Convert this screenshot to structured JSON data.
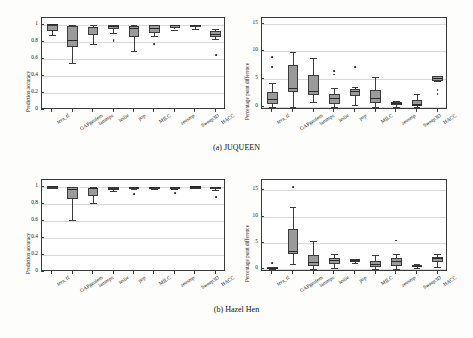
{
  "figure": {
    "captions": [
      {
        "id": "a",
        "text": "(a) JUQUEEN"
      },
      {
        "id": "b",
        "text": "(b) Hazel Hen"
      }
    ]
  },
  "chart_data": [
    {
      "type": "box",
      "panel": "juqueen-accuracy",
      "title": "",
      "xlabel": "",
      "ylabel": "Prediction accuracy",
      "ylim": [
        0,
        1.08
      ],
      "yticks": [
        0,
        0.2,
        0.4,
        0.6,
        0.8,
        1
      ],
      "ytick_labels": [
        "0",
        "0.2",
        "0.4",
        "0.6",
        "0.8",
        "1"
      ],
      "grid": true,
      "categories": [
        "tera_tf",
        "GAPgeofem",
        "lammps",
        "leslie",
        "pop",
        "MILC",
        "zeusmp",
        "Sweep3D",
        "HACC"
      ],
      "boxes": [
        {
          "category": "tera_tf",
          "q1": 0.925,
          "median": 1.0,
          "q3": 1.0,
          "whisker_low": 0.885,
          "whisker_high": 1.0,
          "outliers": []
        },
        {
          "category": "GAPgeofem",
          "q1": 0.745,
          "median": 0.815,
          "q3": 0.985,
          "whisker_low": 0.555,
          "whisker_high": 1.0,
          "outliers": []
        },
        {
          "category": "lammps",
          "q1": 0.875,
          "median": 0.965,
          "q3": 0.975,
          "whisker_low": 0.775,
          "whisker_high": 1.0,
          "outliers": []
        },
        {
          "category": "leslie",
          "q1": 0.945,
          "median": 0.975,
          "q3": 0.995,
          "whisker_low": 0.905,
          "whisker_high": 1.0,
          "outliers": [
            0.825,
            0.805
          ]
        },
        {
          "category": "pop",
          "q1": 0.855,
          "median": 0.955,
          "q3": 0.985,
          "whisker_low": 0.69,
          "whisker_high": 1.0,
          "outliers": []
        },
        {
          "category": "MILC",
          "q1": 0.905,
          "median": 0.955,
          "q3": 0.995,
          "whisker_low": 0.87,
          "whisker_high": 1.0,
          "outliers": [
            0.775
          ]
        },
        {
          "category": "zeusmp",
          "q1": 0.965,
          "median": 0.995,
          "q3": 1.0,
          "whisker_low": 0.945,
          "whisker_high": 1.0,
          "outliers": []
        },
        {
          "category": "Sweep3D",
          "q1": 0.975,
          "median": 0.995,
          "q3": 1.0,
          "whisker_low": 0.955,
          "whisker_high": 1.0,
          "outliers": []
        },
        {
          "category": "HACC",
          "q1": 0.855,
          "median": 0.885,
          "q3": 0.925,
          "whisker_low": 0.835,
          "whisker_high": 0.955,
          "outliers": [
            0.645
          ]
        }
      ]
    },
    {
      "type": "box",
      "panel": "juqueen-difference",
      "title": "",
      "xlabel": "",
      "ylabel": "Percentage point difference",
      "ylim": [
        -0.6,
        16
      ],
      "yticks": [
        0,
        5,
        10,
        15
      ],
      "ytick_labels": [
        "0",
        "5",
        "10",
        "15"
      ],
      "grid": true,
      "categories": [
        "tera_tf",
        "GAPgeofem",
        "lammps",
        "leslie",
        "pop",
        "MILC",
        "zeusmp",
        "Sweep3D",
        "HACC"
      ],
      "boxes": [
        {
          "category": "tera_tf",
          "q1": 0.5,
          "median": 1.3,
          "q3": 2.7,
          "whisker_low": 0.0,
          "whisker_high": 4.2,
          "outliers": [
            9.0,
            7.1
          ]
        },
        {
          "category": "GAPgeofem",
          "q1": 2.7,
          "median": 3.2,
          "q3": 7.6,
          "whisker_low": 0.0,
          "whisker_high": 9.9,
          "outliers": []
        },
        {
          "category": "lammps",
          "q1": 2.1,
          "median": 2.8,
          "q3": 5.8,
          "whisker_low": 0.8,
          "whisker_high": 8.8,
          "outliers": []
        },
        {
          "category": "leslie",
          "q1": 0.5,
          "median": 1.5,
          "q3": 2.3,
          "whisker_low": 0.0,
          "whisker_high": 3.4,
          "outliers": [
            6.4,
            5.8
          ]
        },
        {
          "category": "pop",
          "q1": 2.0,
          "median": 2.8,
          "q3": 3.1,
          "whisker_low": 0.3,
          "whisker_high": 3.6,
          "outliers": [
            7.1
          ]
        },
        {
          "category": "MILC",
          "q1": 0.6,
          "median": 1.5,
          "q3": 3.0,
          "whisker_low": 0.0,
          "whisker_high": 5.4,
          "outliers": []
        },
        {
          "category": "zeusmp",
          "q1": 0.3,
          "median": 0.6,
          "q3": 0.9,
          "whisker_low": 0.0,
          "whisker_high": 1.1,
          "outliers": []
        },
        {
          "category": "Sweep3D",
          "q1": 0.1,
          "median": 0.3,
          "q3": 1.2,
          "whisker_low": 0.0,
          "whisker_high": 2.3,
          "outliers": []
        },
        {
          "category": "HACC",
          "q1": 4.7,
          "median": 5.1,
          "q3": 5.5,
          "whisker_low": 4.6,
          "whisker_high": 5.6,
          "outliers": [
            3.0,
            2.2
          ]
        }
      ]
    },
    {
      "type": "box",
      "panel": "hazelhen-accuracy",
      "title": "",
      "xlabel": "",
      "ylabel": "Prediction accuracy",
      "ylim": [
        0,
        1.08
      ],
      "yticks": [
        0,
        0.2,
        0.4,
        0.6,
        0.8,
        1
      ],
      "ytick_labels": [
        "0",
        "0.2",
        "0.4",
        "0.6",
        "0.8",
        "1"
      ],
      "grid": true,
      "categories": [
        "tera_tf",
        "GAPgeofem",
        "lammps",
        "leslie",
        "pop",
        "MILC",
        "zeusmp",
        "Sweep3D",
        "HACC"
      ],
      "boxes": [
        {
          "category": "tera_tf",
          "q1": 0.995,
          "median": 1.0,
          "q3": 1.0,
          "whisker_low": 0.99,
          "whisker_high": 1.0,
          "outliers": []
        },
        {
          "category": "GAPgeofem",
          "q1": 0.855,
          "median": 0.965,
          "q3": 0.995,
          "whisker_low": 0.615,
          "whisker_high": 1.0,
          "outliers": []
        },
        {
          "category": "lammps",
          "q1": 0.895,
          "median": 0.975,
          "q3": 0.985,
          "whisker_low": 0.805,
          "whisker_high": 1.0,
          "outliers": []
        },
        {
          "category": "leslie",
          "q1": 0.965,
          "median": 0.985,
          "q3": 0.995,
          "whisker_low": 0.95,
          "whisker_high": 1.0,
          "outliers": []
        },
        {
          "category": "pop",
          "q1": 0.98,
          "median": 0.99,
          "q3": 0.998,
          "whisker_low": 0.975,
          "whisker_high": 1.0,
          "outliers": [
            0.915
          ]
        },
        {
          "category": "MILC",
          "q1": 0.985,
          "median": 0.995,
          "q3": 1.0,
          "whisker_low": 0.975,
          "whisker_high": 1.0,
          "outliers": []
        },
        {
          "category": "zeusmp",
          "q1": 0.985,
          "median": 0.995,
          "q3": 1.0,
          "whisker_low": 0.975,
          "whisker_high": 1.0,
          "outliers": [
            0.925
          ]
        },
        {
          "category": "Sweep3D",
          "q1": 0.99,
          "median": 0.998,
          "q3": 1.0,
          "whisker_low": 0.985,
          "whisker_high": 1.0,
          "outliers": []
        },
        {
          "category": "HACC",
          "q1": 0.975,
          "median": 0.99,
          "q3": 1.0,
          "whisker_low": 0.96,
          "whisker_high": 1.0,
          "outliers": [
            0.875
          ]
        }
      ]
    },
    {
      "type": "box",
      "panel": "hazelhen-difference",
      "title": "",
      "xlabel": "",
      "ylabel": "Percentage point difference",
      "ylim": [
        -0.6,
        17
      ],
      "yticks": [
        0,
        5,
        10,
        15
      ],
      "ytick_labels": [
        "0",
        "5",
        "10",
        "15"
      ],
      "grid": true,
      "categories": [
        "tera_tf",
        "GAPgeofem",
        "lammps",
        "leslie",
        "pop",
        "MILC",
        "zeusmp",
        "Sweep3D",
        "HACC"
      ],
      "boxes": [
        {
          "category": "tera_tf",
          "q1": 0.0,
          "median": 0.1,
          "q3": 0.3,
          "whisker_low": 0.0,
          "whisker_high": 0.4,
          "outliers": [
            1.1
          ]
        },
        {
          "category": "GAPgeofem",
          "q1": 2.9,
          "median": 3.4,
          "q3": 7.7,
          "whisker_low": 1.0,
          "whisker_high": 11.9,
          "outliers": [
            15.7
          ]
        },
        {
          "category": "lammps",
          "q1": 0.5,
          "median": 1.3,
          "q3": 2.6,
          "whisker_low": 0.0,
          "whisker_high": 5.3,
          "outliers": []
        },
        {
          "category": "leslie",
          "q1": 0.9,
          "median": 1.6,
          "q3": 2.0,
          "whisker_low": 0.1,
          "whisker_high": 2.9,
          "outliers": []
        },
        {
          "category": "pop",
          "q1": 1.3,
          "median": 1.6,
          "q3": 1.8,
          "whisker_low": 1.1,
          "whisker_high": 1.9,
          "outliers": []
        },
        {
          "category": "MILC",
          "q1": 0.3,
          "median": 0.8,
          "q3": 1.5,
          "whisker_low": 0.0,
          "whisker_high": 2.6,
          "outliers": []
        },
        {
          "category": "zeusmp",
          "q1": 0.6,
          "median": 1.4,
          "q3": 2.1,
          "whisker_low": 0.0,
          "whisker_high": 2.9,
          "outliers": [
            5.4
          ]
        },
        {
          "category": "Sweep3D",
          "q1": 0.3,
          "median": 0.5,
          "q3": 0.8,
          "whisker_low": 0.1,
          "whisker_high": 0.9,
          "outliers": []
        },
        {
          "category": "HACC",
          "q1": 1.3,
          "median": 1.9,
          "q3": 2.3,
          "whisker_low": 0.4,
          "whisker_high": 2.9,
          "outliers": []
        }
      ]
    }
  ]
}
